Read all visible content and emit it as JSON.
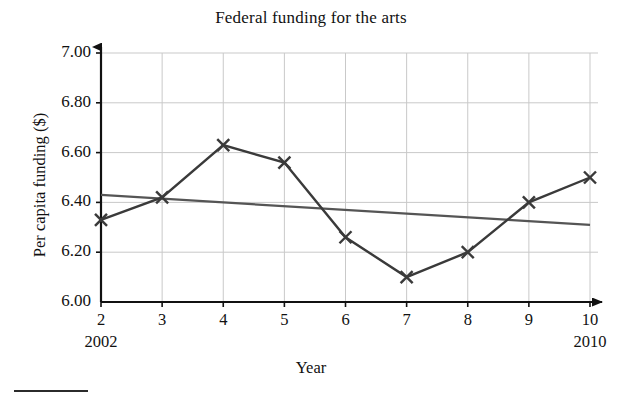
{
  "chart_data": {
    "type": "line",
    "title": "Federal funding for the arts",
    "xlabel": "Year",
    "ylabel": "Per capita funding ($)",
    "x": [
      2,
      3,
      4,
      5,
      6,
      7,
      8,
      9,
      10
    ],
    "values": [
      6.33,
      6.42,
      6.63,
      6.56,
      6.26,
      6.1,
      6.2,
      6.4,
      6.5
    ],
    "series": [
      {
        "name": "Per capita funding",
        "marker": "x-cross",
        "values": [
          6.33,
          6.42,
          6.63,
          6.56,
          6.26,
          6.1,
          6.2,
          6.4,
          6.5
        ]
      },
      {
        "name": "Trend line",
        "marker": "none",
        "endpoints": [
          {
            "x": 2,
            "y": 6.43
          },
          {
            "x": 10,
            "y": 6.31
          }
        ]
      }
    ],
    "xlim": [
      2,
      10
    ],
    "ylim": [
      6.0,
      7.0
    ],
    "xticks": [
      2,
      3,
      4,
      5,
      6,
      7,
      8,
      9,
      10
    ],
    "xtick_labels": [
      "2",
      "3",
      "4",
      "5",
      "6",
      "7",
      "8",
      "9",
      "10"
    ],
    "xtick_sublabels": {
      "2": "2002",
      "10": "2010"
    },
    "yticks": [
      6.0,
      6.2,
      6.4,
      6.6,
      6.8,
      7.0
    ],
    "ytick_labels": [
      "6.00",
      "6.20",
      "6.40",
      "6.60",
      "6.80",
      "7.00"
    ],
    "grid": true,
    "legend": "none",
    "colors": {
      "data_line": "#3a3a3a",
      "trend_line": "#555555",
      "axis": "#111111",
      "grid": "#c9c9c9"
    }
  }
}
